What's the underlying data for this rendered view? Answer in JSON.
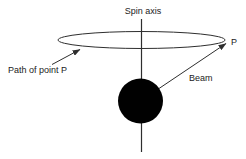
{
  "diagram": {
    "labels": {
      "spin_axis": "Spin axis",
      "path_of_point": "Path of point P",
      "point": "P",
      "beam": "Beam"
    },
    "colors": {
      "line": "#2e2e2e",
      "text": "#222222",
      "sphere_fill": "#010101",
      "background": "#ffffff"
    }
  }
}
